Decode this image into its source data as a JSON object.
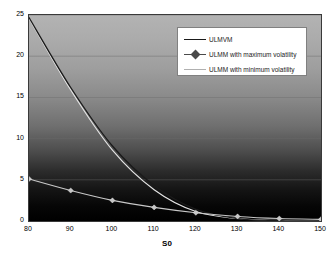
{
  "chart_data": {
    "type": "line",
    "title": "",
    "xlabel": "S0",
    "ylabel": "",
    "xlim": [
      80,
      150
    ],
    "ylim": [
      0,
      25
    ],
    "xticks": [
      "80",
      "90",
      "100",
      "110",
      "120",
      "130",
      "140",
      "150"
    ],
    "yticks": [
      "0",
      "5",
      "10",
      "15",
      "20",
      "25"
    ],
    "grid": "horizontal",
    "legend_position": "top-right",
    "x": [
      80,
      90,
      100,
      110,
      120,
      130,
      140,
      150
    ],
    "series": [
      {
        "name": "ULMVM",
        "color": "#1a1a1a",
        "marker": "none",
        "values": [
          24.7,
          16.2,
          9.1,
          4.3,
          1.4,
          0.3,
          0.05,
          0.0
        ]
      },
      {
        "name": "ULMM with maximum volatility",
        "color": "#c8c8c8",
        "marker": "diamond",
        "values": [
          5.1,
          3.7,
          2.5,
          1.65,
          1.0,
          0.55,
          0.3,
          0.2
        ]
      },
      {
        "name": "ULMM with minimum volatility",
        "color": "#e6e6e6",
        "marker": "none",
        "values": [
          24.6,
          15.9,
          8.6,
          3.8,
          1.15,
          0.3,
          0.07,
          0.0
        ]
      }
    ]
  },
  "legend": {
    "items": [
      {
        "label": "ULMVM",
        "color": "#1a1a1a",
        "marker": "none"
      },
      {
        "label": "ULMM with maximum volatility",
        "color": "#4a4a4a",
        "marker": "diamond"
      },
      {
        "label": "ULMM with minimum volatility",
        "color": "#b0b0b0",
        "marker": "none"
      }
    ]
  },
  "axes": {
    "x_title": "S0",
    "x_tick_labels": [
      "80",
      "90",
      "100",
      "110",
      "120",
      "130",
      "140",
      "150"
    ],
    "y_tick_labels": [
      "0",
      "5",
      "10",
      "15",
      "20",
      "25"
    ]
  },
  "colors": {
    "plot_top": "#b3b3b3",
    "plot_bottom": "#000000",
    "frame": "#3a3a3a",
    "gridline": "#6a6a6a",
    "series_dark": "#1a1a1a",
    "series_light": "#e6e6e6",
    "series_marker": "#c8c8c8",
    "legend_bg": "#ffffff",
    "legend_border": "#808080"
  }
}
